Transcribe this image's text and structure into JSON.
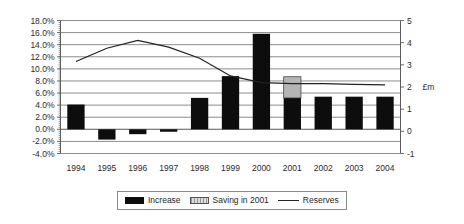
{
  "chart_data": {
    "type": "bar",
    "title": "",
    "subtitle": "",
    "xlabel": "",
    "ylabel": "",
    "categories": [
      "1994",
      "1995",
      "1996",
      "1997",
      "1998",
      "1999",
      "2000",
      "2001",
      "2002",
      "2003",
      "2004"
    ],
    "axes": {
      "left": {
        "label": "",
        "ticks": [
          "18.0%",
          "16.0%",
          "14.0%",
          "12.0%",
          "10.0%",
          "8.0%",
          "6.0%",
          "4.0%",
          "2.0%",
          "0.0%",
          "-2.0%",
          "-4.0%"
        ],
        "tick_values": [
          18,
          16,
          14,
          12,
          10,
          8,
          6,
          4,
          2,
          0,
          -2,
          -4
        ],
        "min": -4,
        "max": 18,
        "step": 2,
        "format": "percent"
      },
      "right": {
        "label": "£m",
        "ticks": [
          "5",
          "4",
          "3",
          "2",
          "1",
          "0",
          "-1"
        ],
        "tick_values": [
          5,
          4,
          3,
          2,
          1,
          0,
          -1
        ],
        "min": -1,
        "max": 5,
        "step": 1,
        "format": "number"
      }
    },
    "grid": true,
    "legend_position": "bottom",
    "series": [
      {
        "name": "Increase",
        "type": "bar",
        "axis": "left",
        "color": "#0d0d0d",
        "values": [
          4.1,
          -1.7,
          -0.8,
          -0.4,
          5.2,
          8.8,
          15.8,
          5.2,
          5.4,
          5.4,
          5.4
        ]
      },
      {
        "name": "Saving in 2001",
        "type": "bar-stacked",
        "axis": "left",
        "color": "#b5b5b5",
        "values": [
          0,
          0,
          0,
          0,
          0,
          0,
          0,
          3.5,
          0,
          0,
          0
        ],
        "base": [
          0,
          0,
          0,
          0,
          0,
          0,
          0,
          5.2,
          0,
          0,
          0
        ]
      },
      {
        "name": "Reserves",
        "type": "line",
        "axis": "right",
        "color": "#222222",
        "values": [
          3.15,
          3.75,
          4.1,
          3.8,
          3.3,
          2.5,
          2.2,
          2.15,
          2.15,
          2.12,
          2.1
        ]
      }
    ]
  },
  "legend": {
    "items": [
      {
        "label": "Increase",
        "marker": "black-bar-swatch"
      },
      {
        "label": "Saving in 2001",
        "marker": "grey-hatched-bar-swatch"
      },
      {
        "label": "Reserves",
        "marker": "line-swatch"
      }
    ]
  }
}
